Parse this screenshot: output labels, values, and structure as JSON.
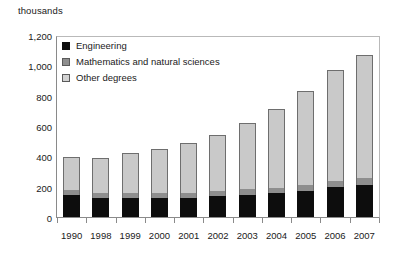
{
  "chart_data": {
    "type": "bar",
    "title": "thousands",
    "subtitle": "",
    "xlabel": "",
    "ylabel": "thousands",
    "stacked": true,
    "grid": false,
    "legend_position": "top-left-inside",
    "ylim": [
      0,
      1200
    ],
    "ytick_step": 200,
    "ytick_labels": [
      "1,200",
      "1,000",
      "800",
      "600",
      "400",
      "200",
      "0"
    ],
    "ytick_values": [
      1200,
      1000,
      800,
      600,
      400,
      200,
      0
    ],
    "categories": [
      "1990",
      "1998",
      "1999",
      "2000",
      "2001",
      "2002",
      "2003",
      "2004",
      "2005",
      "2006",
      "2007"
    ],
    "series": [
      {
        "name": "Engineering",
        "color": "#0d0d0d",
        "values": [
          148,
          128,
          130,
          128,
          130,
          138,
          148,
          158,
          175,
          198,
          215
        ]
      },
      {
        "name": "Mathematics and natural sciences",
        "color": "#8e8e8e",
        "values": [
          32,
          30,
          30,
          32,
          32,
          34,
          36,
          38,
          40,
          42,
          45
        ]
      },
      {
        "name": "Other degrees",
        "color": "#c9c9c9",
        "values": [
          220,
          237,
          265,
          295,
          333,
          373,
          441,
          524,
          625,
          740,
          820
        ]
      }
    ],
    "totals": [
      400,
      395,
      425,
      455,
      495,
      545,
      625,
      720,
      840,
      980,
      1080
    ]
  },
  "legend": {
    "items": [
      {
        "label": "Engineering",
        "swatch": "black-swatch"
      },
      {
        "label": "Mathematics and natural sciences",
        "swatch": "gray-swatch"
      },
      {
        "label": "Other degrees",
        "swatch": "light-gray-swatch"
      }
    ]
  }
}
